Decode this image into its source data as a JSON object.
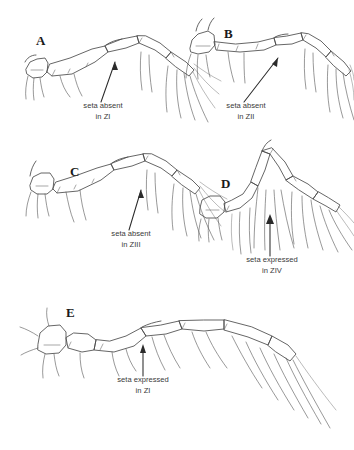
{
  "figure": {
    "background_color": "#ffffff",
    "line_color": "#4a4a4a",
    "text_color": "#3a3a3a",
    "width": 354,
    "height": 450
  },
  "panels": [
    {
      "letter": "A",
      "letter_x": 36,
      "letter_y": 45,
      "annotation_line1": "seta absent",
      "annotation_line2": "in ZI",
      "anno_x": 103,
      "anno_y1": 108,
      "anno_y2": 119
    },
    {
      "letter": "B",
      "letter_x": 224,
      "letter_y": 38,
      "annotation_line1": "seta absent",
      "annotation_line2": "in ZII",
      "anno_x": 246,
      "anno_y1": 108,
      "anno_y2": 119
    },
    {
      "letter": "C",
      "letter_x": 70,
      "letter_y": 176,
      "annotation_line1": "seta absent",
      "annotation_line2": "in ZIII",
      "anno_x": 131,
      "anno_y1": 236,
      "anno_y2": 247
    },
    {
      "letter": "D",
      "letter_x": 221,
      "letter_y": 188,
      "annotation_line1": "seta expressed",
      "annotation_line2": "in ZIV",
      "anno_x": 272,
      "anno_y1": 262,
      "anno_y2": 273
    },
    {
      "letter": "E",
      "letter_x": 66,
      "letter_y": 317,
      "annotation_line1": "seta expressed",
      "annotation_line2": "in ZI",
      "anno_x": 143,
      "anno_y1": 382,
      "anno_y2": 393
    }
  ]
}
